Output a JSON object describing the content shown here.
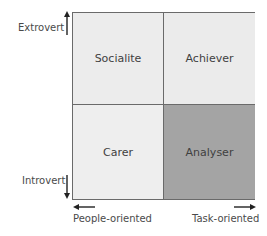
{
  "diagram": {
    "type": "2x2 quadrant matrix",
    "quadrants": [
      {
        "position": "top-left",
        "label": "Socialite",
        "fill": "#ececec"
      },
      {
        "position": "top-right",
        "label": "Achiever",
        "fill": "#ebebeb"
      },
      {
        "position": "bottom-left",
        "label": "Carer",
        "fill": "#eeeeee"
      },
      {
        "position": "bottom-right",
        "label": "Analyser",
        "fill": "#a4a4a4"
      }
    ],
    "y_axis": {
      "top_label": "Extrovert",
      "bottom_label": "Introvert"
    },
    "x_axis": {
      "left_label": "People-oriented",
      "right_label": "Task-oriented"
    }
  }
}
